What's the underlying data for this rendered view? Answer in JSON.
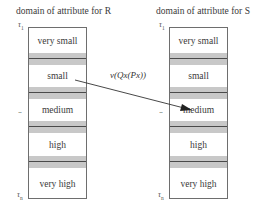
{
  "left": {
    "title": "domain of attribute for R",
    "tau_top": "τ",
    "tau_top_sub": "1",
    "tau_bottom": "τ",
    "tau_bottom_sub": "n",
    "ellipsis": "...",
    "cells": [
      "very small",
      "small",
      "medium",
      "high",
      "very high"
    ]
  },
  "right": {
    "title": "domain of attribute for S",
    "tau_top": "τ",
    "tau_top_sub": "1",
    "tau_bottom": "τ",
    "tau_bottom_sub": "n",
    "ellipsis": "...",
    "cells": [
      "very small",
      "small",
      "medium",
      "high",
      "very high"
    ]
  },
  "mapping": {
    "label": "v(Qx(Px))",
    "from": "small",
    "to": "medium"
  },
  "colors": {
    "band": "#c8c8c8",
    "border": "#6e6e6e",
    "divider": "#4a4a4a"
  }
}
